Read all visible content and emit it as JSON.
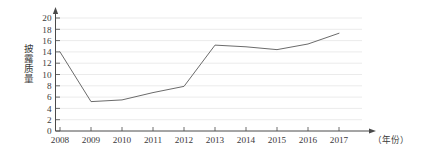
{
  "figure": {
    "y_axis_label": "披露质量",
    "x_axis_unit": "（年份）"
  },
  "chart_data": {
    "type": "line",
    "title": "",
    "subtitle": "",
    "xlabel": "（年份）",
    "ylabel": "披露质量",
    "categories": [
      "2008",
      "2009",
      "2010",
      "2011",
      "2012",
      "2013",
      "2014",
      "2015",
      "2016",
      "2017"
    ],
    "x": [
      2008,
      2009,
      2010,
      2011,
      2012,
      2013,
      2014,
      2015,
      2016,
      2017
    ],
    "values": [
      14.0,
      5.2,
      5.5,
      6.8,
      7.9,
      15.2,
      14.9,
      14.4,
      15.4,
      17.3
    ],
    "series": [
      {
        "name": "披露质量",
        "values": [
          14.0,
          5.2,
          5.5,
          6.8,
          7.9,
          15.2,
          14.9,
          14.4,
          15.4,
          17.3
        ]
      }
    ],
    "ylim": [
      0,
      20
    ],
    "ytick_labels": [
      "0",
      "2",
      "4",
      "6",
      "8",
      "10",
      "12",
      "14",
      "16",
      "18",
      "20"
    ],
    "ytick_values": [
      0,
      2,
      4,
      6,
      8,
      10,
      12,
      14,
      16,
      18,
      20
    ],
    "xtick_labels": [
      "2008",
      "2009",
      "2010",
      "2011",
      "2012",
      "2013",
      "2014",
      "2015",
      "2016",
      "2017"
    ],
    "grid": "horizontal",
    "legend": "none",
    "line_color": "#6b6b6b",
    "grid_color": "#e2e2e2",
    "axis_color": "#4a4a4a",
    "background_color": "#ffffff",
    "markers": "none"
  }
}
